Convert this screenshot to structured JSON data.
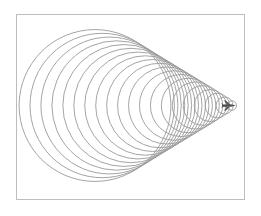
{
  "figure": {
    "frame": {
      "x": 16,
      "y": 14,
      "width": 228,
      "height": 185,
      "stroke": "#bdbdbd"
    },
    "wave_stroke": "#9a9a9a",
    "object_color": "#555555",
    "tip": {
      "x": 241,
      "y": 106
    },
    "axis_y": 105.5,
    "wavefronts": {
      "count": 20,
      "first_center_x": 95,
      "center_spacing": 7.2,
      "radius_ratio": 0.52
    },
    "object": {
      "name": "supersonic-jet",
      "x": 229,
      "y": 105.5
    }
  }
}
